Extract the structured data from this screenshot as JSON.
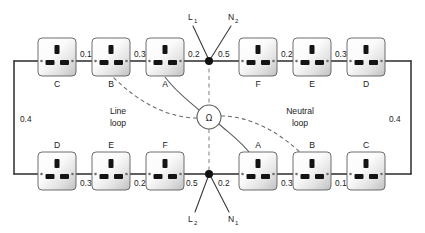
{
  "diagram": {
    "omega_symbol": "Ω",
    "loops": [
      {
        "id": "line-loop",
        "label_line1": "Line",
        "label_line2": "loop",
        "x": 118,
        "y": 116
      },
      {
        "id": "neutral-loop",
        "label_line1": "Neutral",
        "label_line2": "loop",
        "x": 300,
        "y": 116
      }
    ],
    "terminals": [
      {
        "id": "L1",
        "base": "L",
        "sub": "1",
        "x": 191,
        "y": 16
      },
      {
        "id": "N2",
        "base": "N",
        "sub": "2",
        "x": 232,
        "y": 16
      },
      {
        "id": "L2",
        "base": "L",
        "sub": "2",
        "x": 191,
        "y": 222
      },
      {
        "id": "N1",
        "base": "N",
        "sub": "1",
        "x": 232,
        "y": 222
      }
    ],
    "top_row": {
      "sockets": [
        {
          "id": "top-C",
          "label": "C",
          "x": 38,
          "y": 38
        },
        {
          "id": "top-B",
          "label": "B",
          "x": 92,
          "y": 38
        },
        {
          "id": "top-A",
          "label": "A",
          "x": 146,
          "y": 38
        },
        {
          "id": "top-F",
          "label": "F",
          "x": 239,
          "y": 38
        },
        {
          "id": "top-E",
          "label": "E",
          "x": 293,
          "y": 38
        },
        {
          "id": "top-D",
          "label": "D",
          "x": 347,
          "y": 38
        }
      ],
      "resistances": [
        {
          "id": "top-r-CB",
          "value": "0.1",
          "x": 80,
          "y": 45
        },
        {
          "id": "top-r-BA",
          "value": "0.3",
          "x": 134,
          "y": 45
        },
        {
          "id": "top-r-Anode",
          "value": "0.2",
          "x": 188,
          "y": 45
        },
        {
          "id": "top-r-nodeF",
          "value": "0.5",
          "x": 222,
          "y": 45
        },
        {
          "id": "top-r-FE",
          "value": "0.2",
          "x": 281,
          "y": 45
        },
        {
          "id": "top-r-ED",
          "value": "0.3",
          "x": 335,
          "y": 45
        }
      ]
    },
    "bottom_row": {
      "sockets": [
        {
          "id": "bot-D",
          "label": "D",
          "x": 38,
          "y": 152
        },
        {
          "id": "bot-E",
          "label": "E",
          "x": 92,
          "y": 152
        },
        {
          "id": "bot-F",
          "label": "F",
          "x": 146,
          "y": 152
        },
        {
          "id": "bot-A",
          "label": "A",
          "x": 239,
          "y": 152
        },
        {
          "id": "bot-B",
          "label": "B",
          "x": 293,
          "y": 152
        },
        {
          "id": "bot-C",
          "label": "C",
          "x": 347,
          "y": 152
        }
      ],
      "resistances": [
        {
          "id": "bot-r-DE",
          "value": "0.3",
          "x": 80,
          "y": 183
        },
        {
          "id": "bot-r-EF",
          "value": "0.2",
          "x": 134,
          "y": 183
        },
        {
          "id": "bot-r-Fnode",
          "value": "0.5",
          "x": 188,
          "y": 183
        },
        {
          "id": "bot-r-nodeA",
          "value": "0.2",
          "x": 222,
          "y": 183
        },
        {
          "id": "bot-r-AB",
          "value": "0.3",
          "x": 281,
          "y": 183
        },
        {
          "id": "bot-r-BC",
          "value": "0.1",
          "x": 335,
          "y": 183
        }
      ]
    },
    "side_resistances": [
      {
        "id": "left-0.4",
        "value": "0.4",
        "x": 20,
        "y": 119
      },
      {
        "id": "right-0.4",
        "value": "0.4",
        "x": 392,
        "y": 119
      }
    ],
    "nodes": [
      {
        "id": "top-node",
        "x": 209,
        "y": 61
      },
      {
        "id": "bottom-node",
        "x": 209,
        "y": 174
      }
    ],
    "omega_node": {
      "x": 209,
      "y": 117,
      "r": 12
    },
    "colors": {
      "wire": "#2b2b2b",
      "socket_stroke": "#5e5e5e",
      "socket_fill_light": "#ffffff",
      "socket_fill_dark": "#c2c2c2",
      "pin": "#141414",
      "dashed": "#8a8a8a",
      "text": "#1a1a1a",
      "background": "#ffffff"
    }
  }
}
